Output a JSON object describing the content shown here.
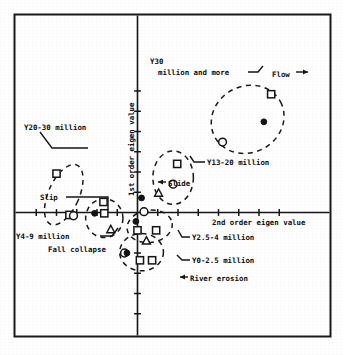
{
  "figure": {
    "axis_x_label": "2nd order eigen value",
    "axis_y_label": "1st order eigen value"
  },
  "annotations": {
    "y30": "Y30",
    "y30_cont": "million and more",
    "flow": "Flow",
    "y13_20": "Y13-20 million",
    "y20_30": "Y20-30 million",
    "slide": "Slide",
    "slip": "Slip",
    "y4_9": "Y4-9 million",
    "fall_collapse": "Fall collapse",
    "y2_5_4": "Y2.5-4 million",
    "y0_2_5": "Y0-2.5 million",
    "river_erosion": "River erosion"
  },
  "chart_data": {
    "type": "scatter",
    "title": "",
    "xlabel": "2nd order eigen value",
    "ylabel": "1st order eigen value",
    "xlim": [
      -3.6,
      4.6
    ],
    "ylim": [
      -4.4,
      3.6
    ],
    "grid": false,
    "legend": null,
    "axes_style": "crosshair-at-origin-with-ticks",
    "x_ticks": [
      -3,
      -2.5,
      -2,
      -1.5,
      -1,
      -0.5,
      0.5,
      1,
      1.5,
      2,
      2.5,
      3,
      3.5
    ],
    "y_ticks": [
      -3.5,
      -3,
      -2.5,
      -2,
      -1.5,
      -1,
      -0.5,
      0.5,
      1,
      1.5,
      2,
      2.5,
      3
    ],
    "marker_types": [
      "square",
      "circle",
      "triangle",
      "filled-dot"
    ],
    "clusters": [
      {
        "name": "Y30 million and more",
        "label": "Y30 million and more",
        "linked_category": "Flow",
        "ellipse": {
          "cx": 2.72,
          "cy": 2.3,
          "rx": 0.92,
          "ry": 0.82,
          "rotation": -28
        },
        "points": [
          {
            "x": 3.3,
            "y": 2.92,
            "marker": "square"
          },
          {
            "x": 2.1,
            "y": 1.74,
            "marker": "circle"
          },
          {
            "x": 3.12,
            "y": 2.24,
            "marker": "filled-dot"
          }
        ]
      },
      {
        "name": "Y13-20 million",
        "label": "Y13-20 million",
        "linked_category": "Slide",
        "ellipse": {
          "cx": 0.88,
          "cy": 0.86,
          "rx": 0.5,
          "ry": 0.66,
          "rotation": 0
        },
        "points": [
          {
            "x": 0.98,
            "y": 1.2,
            "marker": "square"
          },
          {
            "x": 0.88,
            "y": 0.7,
            "marker": "circle"
          },
          {
            "x": 0.52,
            "y": 0.48,
            "marker": "triangle"
          }
        ]
      },
      {
        "name": "Y20-30 million",
        "label": "Y20-30 million",
        "ellipse": {
          "cx": -1.82,
          "cy": 0.44,
          "rx": 0.38,
          "ry": 0.8,
          "rotation": 24
        },
        "points": [
          {
            "x": -2.0,
            "y": 0.96,
            "marker": "square"
          },
          {
            "x": -1.68,
            "y": -0.06,
            "marker": "square"
          },
          {
            "x": -1.58,
            "y": -0.08,
            "marker": "circle"
          }
        ]
      },
      {
        "name": "Y4-9 million",
        "label": "Y4-9 million",
        "linked_category": "Slip",
        "ellipse": {
          "cx": -0.82,
          "cy": -0.14,
          "rx": 0.46,
          "ry": 0.48,
          "rotation": 0
        },
        "points": [
          {
            "x": -0.84,
            "y": 0.26,
            "marker": "square"
          },
          {
            "x": -1.06,
            "y": -0.02,
            "marker": "filled-dot"
          },
          {
            "x": -0.82,
            "y": -0.02,
            "marker": "square"
          },
          {
            "x": -0.66,
            "y": -0.42,
            "marker": "triangle"
          }
        ]
      },
      {
        "name": "Y2.5-4 million",
        "label": "Y2.5-4 million",
        "ellipse": {
          "cx": 0.3,
          "cy": -0.34,
          "rx": 0.56,
          "ry": 0.4,
          "rotation": -8
        },
        "points": [
          {
            "x": 0.16,
            "y": 0.02,
            "marker": "circle"
          },
          {
            "x": -0.04,
            "y": -0.22,
            "marker": "filled-dot"
          },
          {
            "x": 0.0,
            "y": -0.44,
            "marker": "square"
          },
          {
            "x": 0.46,
            "y": -0.44,
            "marker": "square"
          }
        ]
      },
      {
        "name": "Y0-2.5 million",
        "label": "Y0-2.5 million",
        "linked_category": "River erosion",
        "ellipse": {
          "cx": 0.1,
          "cy": -0.98,
          "rx": 0.54,
          "ry": 0.46,
          "rotation": 0
        },
        "points": [
          {
            "x": 0.22,
            "y": -0.7,
            "marker": "triangle"
          },
          {
            "x": -0.32,
            "y": -1.0,
            "marker": "circle"
          },
          {
            "x": -0.26,
            "y": -1.0,
            "marker": "filled-dot"
          },
          {
            "x": 0.06,
            "y": -1.18,
            "marker": "square"
          },
          {
            "x": 0.36,
            "y": -1.18,
            "marker": "square"
          }
        ]
      }
    ],
    "category_markers": [
      {
        "label": "Flow",
        "marker": "filled-dot",
        "x": 3.12,
        "y": 2.24
      },
      {
        "label": "Slide",
        "marker": "filled-dot",
        "x": 0.1,
        "y": 0.36
      },
      {
        "label": "Slip",
        "marker": "filled-dot",
        "x": -1.06,
        "y": -0.02
      },
      {
        "label": "River erosion",
        "marker": "filled-dot",
        "x": 0.8,
        "y": -1.62
      }
    ]
  }
}
